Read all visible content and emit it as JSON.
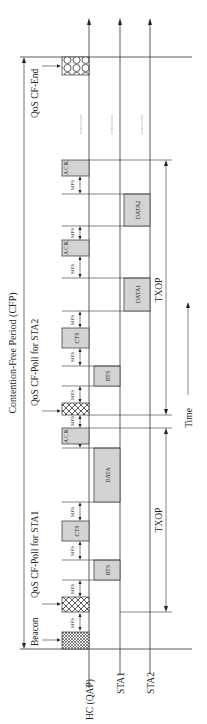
{
  "title": "Contention-Free Period (CFP)",
  "time_label": "Time",
  "stations": [
    {
      "label": "HC (QAP)",
      "x": 89
    },
    {
      "label": "STA1",
      "x": 120
    },
    {
      "label": "STA2",
      "x": 150
    }
  ],
  "frame_labels": {
    "beacon": "Beacon",
    "poll_sta1": "QoS CF-Poll for STA1",
    "poll_sta2": "QoS CF-Poll for STA2",
    "cf_end": "QoS CF-End"
  },
  "sifs_label": "SIFS",
  "ack_letters": [
    "A",
    "C",
    "K"
  ],
  "txop_label": "TXOP",
  "colors": {
    "frame_fill": "#d3d3d3",
    "line": "#333333",
    "background": "#ffffff"
  },
  "frames": [
    {
      "id": "beacon",
      "station": "HC (QAP)",
      "type": "hatched",
      "y1": 632,
      "y2": 649
    },
    {
      "id": "poll1",
      "station": "HC (QAP)",
      "type": "hatched",
      "y1": 597,
      "y2": 612
    },
    {
      "id": "rts1",
      "station": "STA1",
      "type": "gray",
      "label": "RTS",
      "y1": 560,
      "y2": 580
    },
    {
      "id": "cts1",
      "station": "HC (QAP)",
      "type": "gray",
      "label": "CTS",
      "y1": 521,
      "y2": 541
    },
    {
      "id": "data1",
      "station": "STA1",
      "type": "gray",
      "label": "DATA",
      "y1": 448,
      "y2": 502
    },
    {
      "id": "ack1",
      "station": "HC (QAP)",
      "type": "gray",
      "label": "ACK",
      "y1": 428,
      "y2": 444
    },
    {
      "id": "poll2",
      "station": "HC (QAP)",
      "type": "hatched",
      "y1": 403,
      "y2": 415
    },
    {
      "id": "rts2",
      "station": "STA1",
      "type": "gray",
      "label": "RTS",
      "y1": 366,
      "y2": 386
    },
    {
      "id": "cts2",
      "station": "HC (QAP)",
      "type": "gray",
      "label": "CTS",
      "y1": 328,
      "y2": 348
    },
    {
      "id": "data_1",
      "station": "STA1",
      "type": "gray",
      "label": "DATA1",
      "y1": 278,
      "y2": 311
    },
    {
      "id": "ack2",
      "station": "HC (QAP)",
      "type": "gray",
      "label": "ACK",
      "y1": 240,
      "y2": 256
    },
    {
      "id": "data_2",
      "station": "STA2",
      "type": "gray",
      "label": "DATA2",
      "y1": 194,
      "y2": 226
    },
    {
      "id": "ack3",
      "station": "HC (QAP)",
      "type": "gray",
      "label": "ACK",
      "y1": 160,
      "y2": 176
    },
    {
      "id": "cf_end",
      "station": "HC (QAP)",
      "type": "hatched",
      "y1": 57,
      "y2": 75
    }
  ]
}
